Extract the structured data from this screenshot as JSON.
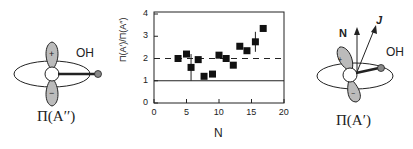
{
  "left_diagram": {
    "molecule_label": "OH",
    "state_label": "Π(A′′)",
    "lobe_top_sign": "+",
    "lobe_bottom_sign": "−"
  },
  "right_diagram": {
    "molecule_label": "OH",
    "state_label": "Π(A′)",
    "vector_n_label": "N",
    "vector_j_label": "J",
    "lobe_top_sign": "+",
    "lobe_bottom_sign": "−"
  },
  "chart_data": {
    "type": "scatter",
    "title": "",
    "xlabel": "N",
    "ylabel": "Π(A′)/Π(A′′)",
    "xlim": [
      0,
      20
    ],
    "ylim": [
      0,
      4
    ],
    "x_ticks": [
      "0",
      "5",
      "10",
      "15",
      "20"
    ],
    "y_ticks": [
      "0",
      "1",
      "2",
      "3",
      "4"
    ],
    "grid": false,
    "legend": null,
    "series": [
      {
        "name": "ratio",
        "marker": "square",
        "points": [
          {
            "x": 3.7,
            "y": 2.0
          },
          {
            "x": 5.0,
            "y": 2.2
          },
          {
            "x": 5.7,
            "y": 1.6,
            "err_low": 1.0,
            "err_high": 2.2
          },
          {
            "x": 6.8,
            "y": 1.95
          },
          {
            "x": 7.7,
            "y": 1.2
          },
          {
            "x": 9.0,
            "y": 1.3
          },
          {
            "x": 10.0,
            "y": 2.15
          },
          {
            "x": 11.1,
            "y": 2.0
          },
          {
            "x": 12.2,
            "y": 1.7
          },
          {
            "x": 13.2,
            "y": 2.55
          },
          {
            "x": 14.3,
            "y": 2.35
          },
          {
            "x": 15.6,
            "y": 2.75,
            "err_low": 2.3,
            "err_high": 3.2
          },
          {
            "x": 16.8,
            "y": 3.35
          }
        ]
      }
    ],
    "reference_lines": [
      {
        "y": 1.0,
        "style": "solid"
      },
      {
        "y": 2.0,
        "style": "dashed"
      }
    ]
  }
}
